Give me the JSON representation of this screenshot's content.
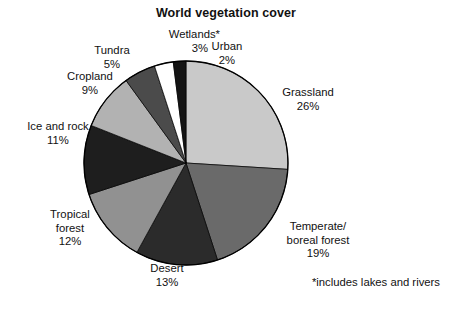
{
  "chart_data": {
    "type": "pie",
    "title": "World vegetation cover",
    "xlabel": "",
    "ylabel": "",
    "units": "percent",
    "legend_position": "none",
    "labels_position": "outside-callout",
    "grid": false,
    "start_angle_deg": 0,
    "direction": "clockwise",
    "categories": [
      "Grassland",
      "Temperate/ boreal forest",
      "Desert",
      "Tropical forest",
      "Ice and rock",
      "Cropland",
      "Tundra",
      "Wetlands*",
      "Urban"
    ],
    "values": [
      26,
      19,
      13,
      12,
      11,
      9,
      5,
      3,
      2
    ],
    "total": 100,
    "annotations": [
      "*includes lakes and rivers"
    ],
    "slices": [
      {
        "key": "grassland",
        "name": "Grassland",
        "value": 26,
        "value_label": "26%",
        "color": "#c9c9c9",
        "start_pct": 0,
        "end_pct": 26
      },
      {
        "key": "temperate_boreal_forest",
        "name_line1": "Temperate/",
        "name_line2": "boreal forest",
        "name": "Temperate/ boreal forest",
        "value": 19,
        "value_label": "19%",
        "color": "#6a6a6a",
        "start_pct": 26,
        "end_pct": 45
      },
      {
        "key": "desert",
        "name": "Desert",
        "value": 13,
        "value_label": "13%",
        "color": "#2b2b2b",
        "start_pct": 45,
        "end_pct": 58
      },
      {
        "key": "tropical_forest",
        "name_line1": "Tropical",
        "name_line2": "forest",
        "name": "Tropical forest",
        "value": 12,
        "value_label": "12%",
        "color": "#919191",
        "start_pct": 58,
        "end_pct": 70
      },
      {
        "key": "ice_and_rock",
        "name": "Ice and rock",
        "value": 11,
        "value_label": "11%",
        "color": "#1e1e1e",
        "start_pct": 70,
        "end_pct": 81
      },
      {
        "key": "cropland",
        "name": "Cropland",
        "value": 9,
        "value_label": "9%",
        "color": "#b2b2b2",
        "start_pct": 81,
        "end_pct": 90
      },
      {
        "key": "tundra",
        "name": "Tundra",
        "value": 5,
        "value_label": "5%",
        "color": "#4b4b4b",
        "start_pct": 90,
        "end_pct": 95
      },
      {
        "key": "wetlands",
        "name": "Wetlands*",
        "value": 3,
        "value_label": "3%",
        "color": "#ffffff",
        "start_pct": 95,
        "end_pct": 98
      },
      {
        "key": "urban",
        "name": "Urban",
        "value": 2,
        "value_label": "2%",
        "color": "#141414",
        "start_pct": 98,
        "end_pct": 100
      }
    ]
  },
  "footnote": "*includes lakes and rivers",
  "geometry": {
    "center_x": 103,
    "center_y": 103,
    "radius": 102,
    "outline_color": "#000000",
    "background": "#ffffff"
  }
}
